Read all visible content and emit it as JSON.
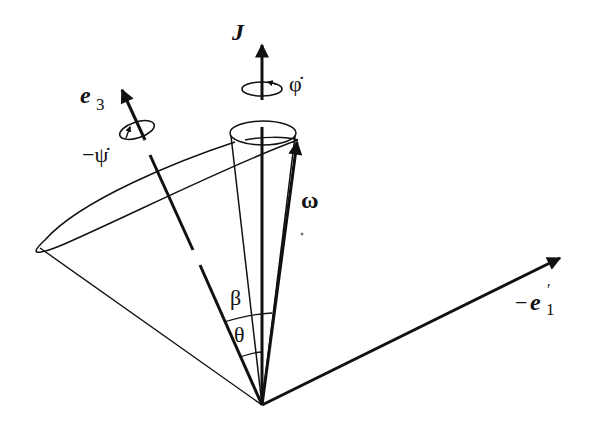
{
  "diagram": {
    "labels": {
      "J": "J",
      "phi_dot": "φ̇",
      "e3": "e",
      "e3_sub": "3",
      "psi_dot": "−ψ̇",
      "omega": "ω",
      "beta": "β",
      "theta": "θ",
      "e1p_minus": "−",
      "e1p": "e",
      "e1p_sub": "1",
      "e1p_prime": "′"
    },
    "vectors": [
      {
        "name": "J",
        "direction": "vertical"
      },
      {
        "name": "e3",
        "direction": "upper-left"
      },
      {
        "name": "omega",
        "direction": "upper-right, near J"
      },
      {
        "name": "-e1'",
        "direction": "right"
      }
    ],
    "angles": [
      {
        "name": "β",
        "between": [
          "J",
          "e3"
        ]
      },
      {
        "name": "θ",
        "between": [
          "e3",
          "omega"
        ]
      }
    ],
    "colors": {
      "stroke": "#111111",
      "background": "#ffffff"
    }
  }
}
